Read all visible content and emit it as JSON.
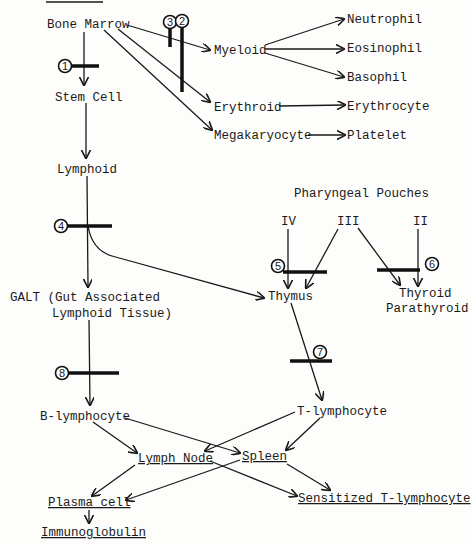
{
  "diagram": {
    "header_rule": true,
    "nodes": {
      "bone_marrow": "Bone Marrow",
      "stem_cell": "Stem Cell",
      "lymphoid": "Lymphoid",
      "myeloid": "Myeloid",
      "erythroid": "Erythroid",
      "megakaryocyte": "Megakaryocyte",
      "neutrophil": "Neutrophil",
      "eosinophil": "Eosinophil",
      "basophil": "Basophil",
      "erythrocyte": "Erythrocyte",
      "platelet": "Platelet",
      "pharyngeal_pouches": "Pharyngeal Pouches",
      "pouch_iv": "IV",
      "pouch_iii": "III",
      "pouch_ii": "II",
      "galt_line1": "GALT (Gut Associated",
      "galt_line2": "Lymphoid Tissue)",
      "thymus": "Thymus",
      "thyroid": "Thyroid",
      "parathyroid": "Parathyroid",
      "b_lymphocyte": "B-lymphocyte",
      "t_lymphocyte": "T-lymphocyte",
      "lymph_node": "Lymph Node",
      "spleen": "Spleen",
      "plasma_cell": "Plasma cell",
      "sensitized_t": "Sensitized T-lymphocyte",
      "immunoglobulin": "Immunoglobulin"
    },
    "blocks": [
      "1",
      "2",
      "3",
      "4",
      "5",
      "6",
      "7",
      "8"
    ],
    "edges": [
      [
        "Bone Marrow",
        "Stem Cell"
      ],
      [
        "Bone Marrow",
        "Myeloid"
      ],
      [
        "Bone Marrow",
        "Erythroid"
      ],
      [
        "Bone Marrow",
        "Megakaryocyte"
      ],
      [
        "Myeloid",
        "Neutrophil"
      ],
      [
        "Myeloid",
        "Eosinophil"
      ],
      [
        "Myeloid",
        "Basophil"
      ],
      [
        "Erythroid",
        "Erythrocyte"
      ],
      [
        "Megakaryocyte",
        "Platelet"
      ],
      [
        "Stem Cell",
        "Lymphoid"
      ],
      [
        "Lymphoid",
        "GALT"
      ],
      [
        "Lymphoid",
        "Thymus"
      ],
      [
        "IV",
        "Thymus"
      ],
      [
        "III",
        "Thymus"
      ],
      [
        "III",
        "Thyroid/Parathyroid"
      ],
      [
        "II",
        "Thyroid/Parathyroid"
      ],
      [
        "GALT",
        "B-lymphocyte"
      ],
      [
        "Thymus",
        "T-lymphocyte"
      ],
      [
        "B-lymphocyte",
        "Lymph Node"
      ],
      [
        "B-lymphocyte",
        "Spleen"
      ],
      [
        "T-lymphocyte",
        "Lymph Node"
      ],
      [
        "T-lymphocyte",
        "Spleen"
      ],
      [
        "Lymph Node",
        "Plasma cell"
      ],
      [
        "Lymph Node",
        "Sensitized T-lymphocyte"
      ],
      [
        "Spleen",
        "Plasma cell"
      ],
      [
        "Spleen",
        "Sensitized T-lymphocyte"
      ],
      [
        "Plasma cell",
        "Immunoglobulin"
      ]
    ]
  }
}
